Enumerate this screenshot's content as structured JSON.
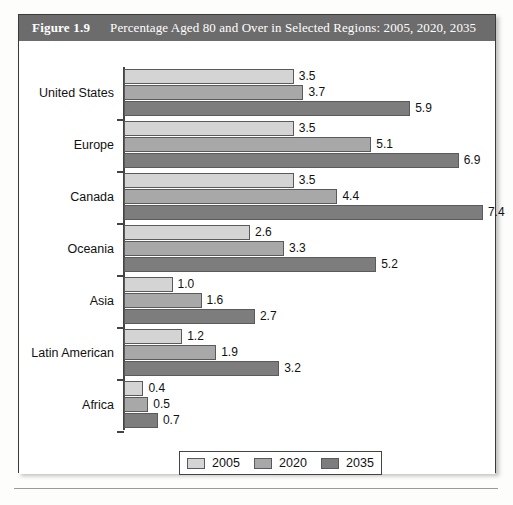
{
  "figure": {
    "label": "Figure 1.9",
    "title": "Percentage Aged 80 and Over in Selected Regions: 2005, 2020, 2035"
  },
  "legend": {
    "items": [
      {
        "label": "2005",
        "color": "#d4d4d4"
      },
      {
        "label": "2020",
        "color": "#a8a8a8"
      },
      {
        "label": "2035",
        "color": "#7d7d7d"
      }
    ]
  },
  "chart_data": {
    "type": "bar",
    "orientation": "horizontal",
    "title": "Percentage Aged 80 and Over in Selected Regions: 2005, 2020, 2035",
    "xlabel": "",
    "ylabel": "",
    "grid": false,
    "legend_position": "bottom",
    "xlim": [
      0,
      7.6
    ],
    "categories": [
      "United States",
      "Europe",
      "Canada",
      "Oceania",
      "Asia",
      "Latin American",
      "Africa"
    ],
    "series": [
      {
        "name": "2005",
        "color": "#d4d4d4",
        "values": [
          3.5,
          3.5,
          3.5,
          2.6,
          1.0,
          1.2,
          0.4
        ]
      },
      {
        "name": "2020",
        "color": "#a8a8a8",
        "values": [
          3.7,
          5.1,
          4.4,
          3.3,
          1.6,
          1.9,
          0.5
        ]
      },
      {
        "name": "2035",
        "color": "#7d7d7d",
        "values": [
          5.9,
          6.9,
          7.4,
          5.2,
          2.7,
          3.2,
          0.7
        ]
      }
    ],
    "value_labels": [
      [
        "3.5",
        "3.7",
        "5.9"
      ],
      [
        "3.5",
        "5.1",
        "6.9"
      ],
      [
        "3.5",
        "4.4",
        "7.4"
      ],
      [
        "2.6",
        "3.3",
        "5.2"
      ],
      [
        "1.0",
        "1.6",
        "2.7"
      ],
      [
        "1.2",
        "1.9",
        "3.2"
      ],
      [
        "0.4",
        "0.5",
        "0.7"
      ]
    ]
  }
}
